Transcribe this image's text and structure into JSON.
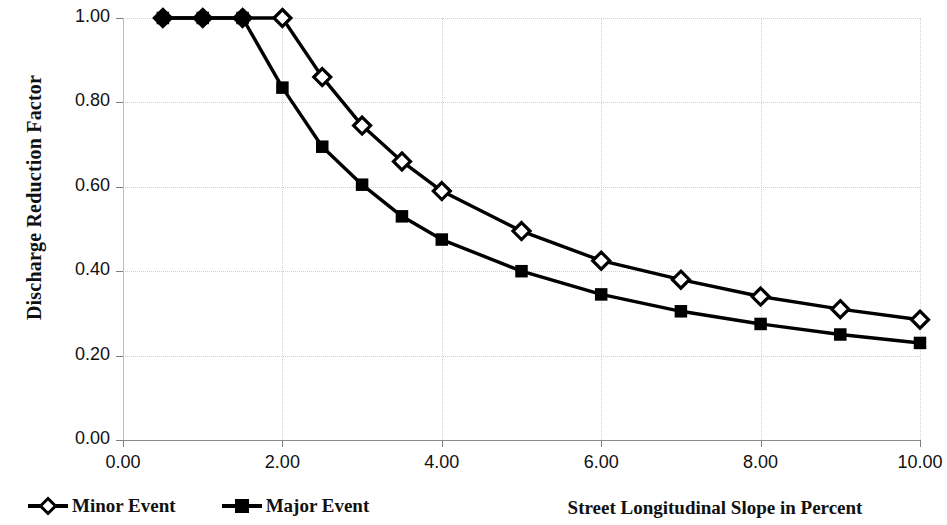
{
  "chart_data": {
    "type": "line",
    "title": "",
    "xlabel": "Street Longitudinal Slope in Percent",
    "ylabel": "Discharge Reduction Factor",
    "xlim": [
      0.0,
      10.0
    ],
    "ylim": [
      0.0,
      1.0
    ],
    "xticks": [
      "0.00",
      "2.00",
      "4.00",
      "6.00",
      "8.00",
      "10.00"
    ],
    "xtick_values": [
      0,
      2,
      4,
      6,
      8,
      10
    ],
    "yticks": [
      "0.00",
      "0.20",
      "0.40",
      "0.60",
      "0.80",
      "1.00"
    ],
    "ytick_values": [
      0.0,
      0.2,
      0.4,
      0.6,
      0.8,
      1.0
    ],
    "grid": true,
    "legend_position": "bottom-left",
    "series": [
      {
        "name": "Minor Event",
        "marker": "open-diamond",
        "x": [
          0.5,
          1.0,
          1.5,
          2.0,
          2.5,
          3.0,
          3.5,
          4.0,
          5.0,
          6.0,
          7.0,
          8.0,
          9.0,
          10.0
        ],
        "values": [
          1.0,
          1.0,
          1.0,
          1.0,
          0.86,
          0.745,
          0.66,
          0.59,
          0.495,
          0.425,
          0.38,
          0.34,
          0.31,
          0.285
        ]
      },
      {
        "name": "Major Event",
        "marker": "filled-square",
        "x": [
          0.5,
          1.0,
          1.5,
          2.0,
          2.5,
          3.0,
          3.5,
          4.0,
          5.0,
          6.0,
          7.0,
          8.0,
          9.0,
          10.0
        ],
        "values": [
          1.0,
          1.0,
          1.0,
          0.835,
          0.695,
          0.605,
          0.53,
          0.475,
          0.4,
          0.345,
          0.305,
          0.275,
          0.25,
          0.23
        ]
      }
    ],
    "line_color": "#000000"
  },
  "legend": {
    "items": [
      {
        "label": "Minor Event",
        "marker": "open-diamond-icon"
      },
      {
        "label": "Major Event",
        "marker": "filled-square-icon"
      }
    ]
  },
  "axis_titles": {
    "y": "Discharge Reduction Factor",
    "x": "Street Longitudinal Slope in Percent"
  }
}
